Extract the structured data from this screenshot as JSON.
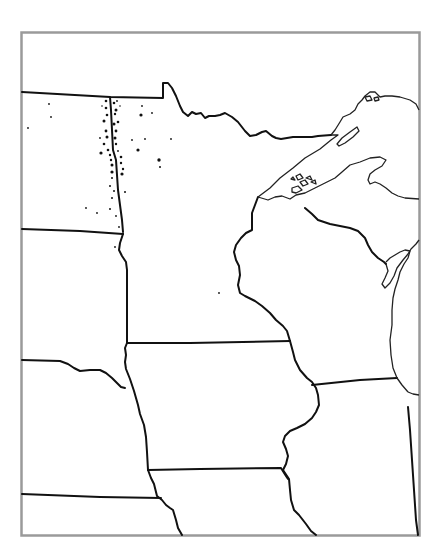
{
  "map": {
    "type": "outline-dot-distribution",
    "region": "Upper Midwest United States",
    "frame_color": "#9a9a9a",
    "border_color": "#111111",
    "shoreline_color": "#222222",
    "dot_color": "#111111",
    "background": "#ffffff",
    "regions_depicted": [
      "North Dakota",
      "South Dakota",
      "Nebraska",
      "Minnesota",
      "Iowa",
      "Wisconsin",
      "Michigan",
      "Illinois",
      "Missouri",
      "Lake Superior",
      "Lake Michigan"
    ],
    "dot_cluster": "Red River Valley (ND/MN border)",
    "labels": []
  }
}
